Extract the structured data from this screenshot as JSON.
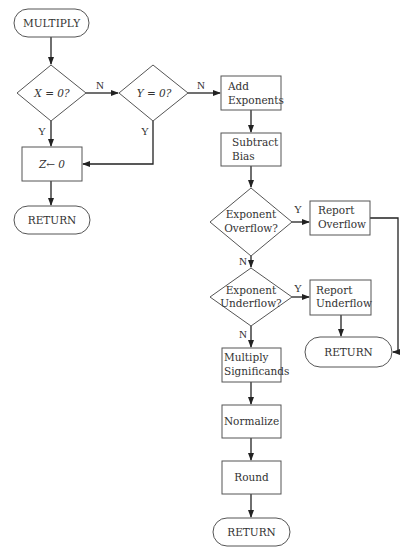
{
  "diagram": {
    "nodes": {
      "start": {
        "type": "terminal",
        "label": "MULTIPLY"
      },
      "x_zero": {
        "type": "decision",
        "label": "X = 0?"
      },
      "y_zero": {
        "type": "decision",
        "label": "Y = 0?"
      },
      "z_zero": {
        "type": "process",
        "label": "Z← 0"
      },
      "return_left": {
        "type": "terminal",
        "label": "RETURN"
      },
      "add_exp": {
        "type": "process",
        "line1": "Add",
        "line2": "Exponents"
      },
      "sub_bias": {
        "type": "process",
        "line1": "Subtract",
        "line2": "Bias"
      },
      "exp_overflow": {
        "type": "decision",
        "line1": "Exponent",
        "line2": "Overflow?"
      },
      "report_overflow": {
        "type": "process",
        "line1": "Report",
        "line2": "Overflow"
      },
      "exp_underflow": {
        "type": "decision",
        "line1": "Exponent",
        "line2": "Underflow?"
      },
      "report_underflow": {
        "type": "process",
        "line1": "Report",
        "line2": "Underflow"
      },
      "return_right": {
        "type": "terminal",
        "label": "RETURN"
      },
      "mult_sig": {
        "type": "process",
        "line1": "Multiply",
        "line2": "Significands"
      },
      "normalize": {
        "type": "process",
        "label": "Normalize"
      },
      "round": {
        "type": "process",
        "label": "Round"
      },
      "return_bottom": {
        "type": "terminal",
        "label": "RETURN"
      }
    },
    "edges": {
      "x_no": "N",
      "x_yes": "Y",
      "y_no": "N",
      "y_yes": "Y",
      "overflow_yes": "Y",
      "overflow_no": "N",
      "underflow_yes": "Y",
      "underflow_no": "N"
    }
  }
}
